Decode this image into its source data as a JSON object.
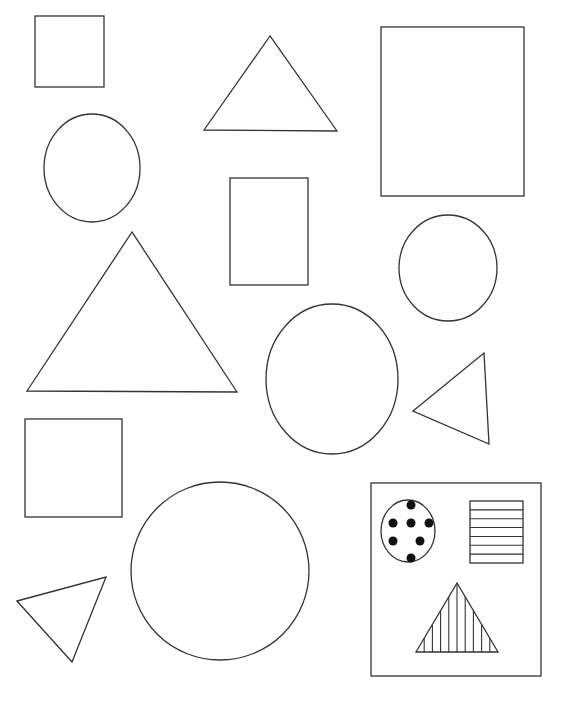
{
  "worksheet": {
    "background": "#ffffff",
    "stroke_color": "#333333",
    "shapes": [
      {
        "type": "square",
        "x": 35,
        "y": 16,
        "w": 69,
        "h": 71
      },
      {
        "type": "triangle",
        "points": [
          [
            270,
            36
          ],
          [
            204,
            130
          ],
          [
            337,
            131
          ]
        ]
      },
      {
        "type": "rectangle",
        "x": 381,
        "y": 27,
        "w": 143,
        "h": 169
      },
      {
        "type": "ellipse",
        "cx": 92,
        "cy": 168,
        "rx": 48,
        "ry": 54
      },
      {
        "type": "rectangle",
        "x": 230,
        "y": 178,
        "w": 78,
        "h": 107
      },
      {
        "type": "ellipse",
        "cx": 448,
        "cy": 268,
        "rx": 49,
        "ry": 53
      },
      {
        "type": "triangle",
        "points": [
          [
            132,
            232
          ],
          [
            27,
            391
          ],
          [
            237,
            392
          ]
        ]
      },
      {
        "type": "ellipse",
        "cx": 332,
        "cy": 379,
        "rx": 66,
        "ry": 75
      },
      {
        "type": "triangle",
        "points": [
          [
            413,
            411
          ],
          [
            484,
            353
          ],
          [
            489,
            444
          ]
        ]
      },
      {
        "type": "square",
        "x": 25,
        "y": 419,
        "w": 97,
        "h": 98
      },
      {
        "type": "circle",
        "cx": 220,
        "cy": 571,
        "rx": 89,
        "ry": 89
      },
      {
        "type": "triangle",
        "points": [
          [
            17,
            601
          ],
          [
            106,
            577
          ],
          [
            72,
            662
          ]
        ]
      }
    ],
    "legend_box": {
      "x": 371,
      "y": 483,
      "w": 170,
      "h": 193,
      "items": [
        {
          "type": "dotted-ellipse",
          "cx": 408,
          "cy": 531,
          "rx": 27,
          "ry": 31,
          "dot_count": 8
        },
        {
          "type": "horizontal-striped-rectangle",
          "x": 470,
          "y": 501,
          "w": 53,
          "h": 62,
          "stripe_count": 7
        },
        {
          "type": "vertical-striped-triangle",
          "points": [
            [
              457,
              583
            ],
            [
              416,
              652
            ],
            [
              498,
              652
            ]
          ],
          "stripe_count": 9
        }
      ]
    }
  }
}
